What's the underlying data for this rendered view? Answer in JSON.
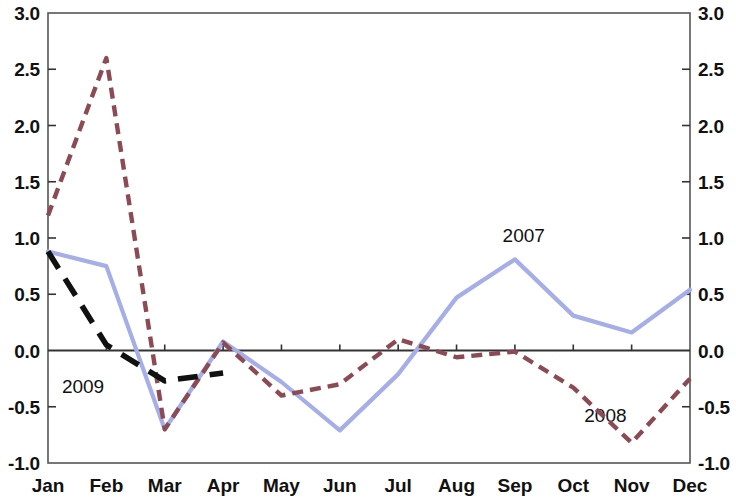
{
  "chart_data": {
    "type": "line",
    "title": "",
    "subtitle": "",
    "xlabel": "",
    "ylabel": "",
    "ylim": [
      -1.0,
      3.0
    ],
    "y_ticks": [
      "3.0",
      "2.5",
      "2.0",
      "1.5",
      "1.0",
      "0.5",
      "0.0",
      "-0.5",
      "-1.0"
    ],
    "y_tick_values": [
      3.0,
      2.5,
      2.0,
      1.5,
      1.0,
      0.5,
      0.0,
      -0.5,
      -1.0
    ],
    "dual_axis": true,
    "grid": false,
    "legend_position": "inline-annotations",
    "categories": [
      "Jan",
      "Feb",
      "Mar",
      "Apr",
      "May",
      "Jun",
      "Jul",
      "Aug",
      "Sep",
      "Oct",
      "Nov",
      "Dec"
    ],
    "series": [
      {
        "name": "2007",
        "color": "#a6aee8",
        "style": "solid",
        "values": [
          0.88,
          0.75,
          -0.7,
          0.08,
          -0.28,
          -0.71,
          -0.21,
          0.47,
          0.81,
          0.31,
          0.16,
          0.54
        ]
      },
      {
        "name": "2008",
        "color": "#8c4a55",
        "style": "dashed",
        "values": [
          1.2,
          2.6,
          -0.7,
          0.07,
          -0.4,
          -0.3,
          0.1,
          -0.06,
          -0.01,
          -0.33,
          -0.82,
          -0.25
        ]
      },
      {
        "name": "2009",
        "color": "#111111",
        "style": "long-dash",
        "values": [
          0.88,
          0.05,
          -0.27,
          -0.2,
          null,
          null,
          null,
          null,
          null,
          null,
          null,
          null
        ]
      }
    ],
    "annotations": [
      {
        "text": "2007",
        "series": "2007",
        "x": 8.2,
        "y": 1.02
      },
      {
        "text": "2008",
        "series": "2008",
        "x": 9.6,
        "y": -0.58
      },
      {
        "text": "2009",
        "series": "2009",
        "x": 0.65,
        "y": -0.32
      }
    ]
  },
  "axes": {
    "left_ticks": [
      "3.0",
      "2.5",
      "2.0",
      "1.5",
      "1.0",
      "0.5",
      "0.0",
      "-0.5",
      "-1.0"
    ],
    "right_ticks": [
      "3.0",
      "2.5",
      "2.0",
      "1.5",
      "1.0",
      "0.5",
      "0.0",
      "-0.5",
      "-1.0"
    ],
    "x_ticks": [
      "Jan",
      "Feb",
      "Mar",
      "Apr",
      "May",
      "Jun",
      "Jul",
      "Aug",
      "Sep",
      "Oct",
      "Nov",
      "Dec"
    ]
  },
  "colors": {
    "series_2007": "#a6aee8",
    "series_2008": "#8c4a55",
    "series_2009": "#111111",
    "axis": "#333333",
    "frame": "#555555",
    "background": "#ffffff"
  }
}
